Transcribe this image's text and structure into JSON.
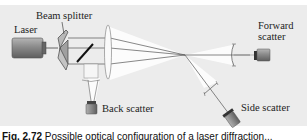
{
  "labels": {
    "laser": "Laser",
    "beam_splitter": "Beam splitter",
    "back_scatter": "Back scatter",
    "forward_scatter_line1": "Forward",
    "forward_scatter_line2": "scatter",
    "side_scatter": "Side scatter"
  },
  "caption": {
    "prefix": "Fig. 2.72",
    "text": "Possible optical configuration of a laser diffraction..."
  },
  "colors": {
    "panel": "#ececec",
    "device": "#8c8c8c",
    "beam": "#555555",
    "lens": "#ffffff"
  }
}
